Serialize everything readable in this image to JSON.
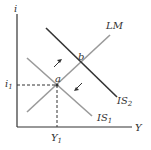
{
  "diagram": {
    "axes": {
      "y_label": "i",
      "x_label": "Y"
    },
    "curves": {
      "lm": {
        "label": "LM",
        "color": "#9a9a9a"
      },
      "is1": {
        "label": "IS",
        "sub": "1",
        "color": "#9a9a9a"
      },
      "is2": {
        "label": "IS",
        "sub": "2",
        "color": "#333333"
      }
    },
    "points": {
      "a": "a",
      "b": "b"
    },
    "ticks": {
      "i1": "i",
      "i1_sub": "1",
      "y1": "Y",
      "y1_sub": "1"
    },
    "arrows": [
      "up-right toward b",
      "down-left toward a"
    ]
  }
}
